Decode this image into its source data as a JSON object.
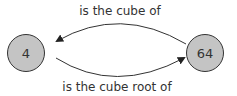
{
  "diagram": {
    "nodes": [
      {
        "id": "n4",
        "label": "4",
        "fill": "#c4c4c4",
        "stroke": "#333333"
      },
      {
        "id": "n64",
        "label": "64",
        "fill": "#c4c4c4",
        "stroke": "#333333"
      }
    ],
    "edges": [
      {
        "from": "64",
        "to": "4",
        "label": "is the cube of"
      },
      {
        "from": "4",
        "to": "64",
        "label": "is the cube root of"
      }
    ]
  }
}
